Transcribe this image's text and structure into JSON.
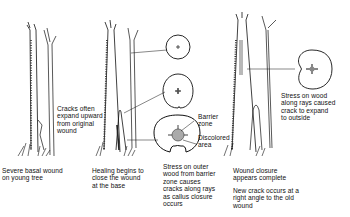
{
  "diagram": {
    "type": "tree-wound-progression",
    "stages": [
      {
        "id": "stage-1",
        "caption": "Severe basal wound\non young tree"
      },
      {
        "id": "stage-2",
        "caption": "Healing begins to\nclose the wound\nat the base"
      },
      {
        "id": "stage-3",
        "caption": "Stress on outer\nwood from barrier\nzone causes\ncracks along rays\nas callus closure\noccurs"
      },
      {
        "id": "stage-4",
        "caption": "Wound closure\nappears complete"
      },
      {
        "id": "stage-5",
        "caption": "New crack occurs at a\nright angle to the old\nwound"
      }
    ],
    "annotations": {
      "cracks_upward": "Cracks often\nexpand upward\nfrom original\nwound",
      "barrier_zone": "Barrier\nzone",
      "discolored_area": "Discolored\narea",
      "stress_rays": "Stress on wood\nalong rays caused\ncrack to expand\nto outside"
    },
    "colors": {
      "ink": "#111111",
      "background": "#ffffff",
      "shade": "#888888"
    }
  }
}
